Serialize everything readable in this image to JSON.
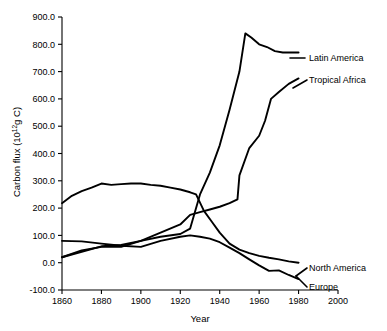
{
  "chart_data": {
    "type": "line",
    "title": "",
    "xlabel": "Year",
    "ylabel": "Carbon flux (10^12 g C)",
    "ylabel_prefix": "Carbon flux (10",
    "ylabel_exponent": "12",
    "ylabel_suffix": "g C)",
    "xlim": [
      1860,
      2000
    ],
    "ylim": [
      -100,
      900
    ],
    "grid": false,
    "legend_position": "right-inline-labels",
    "xticks": [
      1860,
      1880,
      1900,
      1920,
      1940,
      1960,
      1980,
      2000
    ],
    "xtick_labels": [
      "1860",
      "1880",
      "1900",
      "1920",
      "1940",
      "1960",
      "1980",
      "2000"
    ],
    "yticks": [
      -100,
      0,
      100,
      200,
      300,
      400,
      500,
      600,
      700,
      800,
      900
    ],
    "ytick_labels": [
      "-100.0",
      "0.0",
      "100.0",
      "200.0",
      "300.0",
      "400.0",
      "500.0",
      "600.0",
      "700.0",
      "800.0",
      "900.0"
    ],
    "series": [
      {
        "name": "Latin America",
        "label": "Latin America",
        "x": [
          1860,
          1870,
          1880,
          1890,
          1900,
          1910,
          1920,
          1925,
          1930,
          1935,
          1940,
          1945,
          1950,
          1953,
          1956,
          1960,
          1964,
          1968,
          1972,
          1976,
          1980
        ],
        "values": [
          20,
          40,
          60,
          65,
          80,
          95,
          105,
          125,
          250,
          330,
          430,
          560,
          700,
          840,
          825,
          800,
          790,
          775,
          770,
          770,
          770
        ]
      },
      {
        "name": "Tropical Africa",
        "label": "Tropical Africa",
        "x": [
          1860,
          1870,
          1880,
          1890,
          1900,
          1910,
          1920,
          1925,
          1930,
          1935,
          1940,
          1945,
          1949,
          1950,
          1955,
          1960,
          1963,
          1966,
          1970,
          1975,
          1980
        ],
        "values": [
          20,
          45,
          58,
          58,
          80,
          110,
          140,
          175,
          185,
          195,
          205,
          218,
          232,
          320,
          420,
          465,
          520,
          600,
          625,
          655,
          675
        ]
      },
      {
        "name": "North America",
        "label": "North America",
        "x": [
          1860,
          1865,
          1870,
          1875,
          1880,
          1885,
          1890,
          1895,
          1900,
          1905,
          1910,
          1915,
          1920,
          1925,
          1928,
          1932,
          1936,
          1940,
          1945,
          1950,
          1955,
          1960,
          1965,
          1970,
          1975,
          1980
        ],
        "values": [
          218,
          245,
          262,
          275,
          290,
          285,
          288,
          290,
          290,
          285,
          282,
          275,
          268,
          258,
          250,
          190,
          150,
          110,
          70,
          48,
          35,
          25,
          18,
          12,
          5,
          0
        ]
      },
      {
        "name": "Europe",
        "label": "Europe",
        "x": [
          1860,
          1870,
          1880,
          1890,
          1900,
          1910,
          1920,
          1925,
          1930,
          1935,
          1940,
          1945,
          1950,
          1955,
          1960,
          1965,
          1970,
          1975,
          1980
        ],
        "values": [
          80,
          78,
          70,
          62,
          58,
          80,
          95,
          100,
          95,
          88,
          75,
          55,
          35,
          12,
          -10,
          -30,
          -28,
          -45,
          -60
        ]
      }
    ]
  },
  "axes": {
    "x_axis_name": "year-axis",
    "y_axis_name": "carbon-flux-axis"
  }
}
